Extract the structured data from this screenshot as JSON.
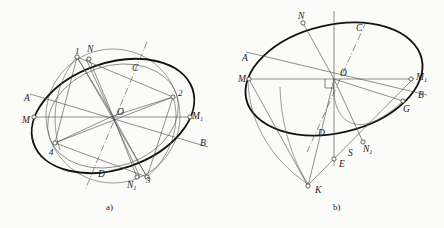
{
  "figure": {
    "background": "#fbfbf9",
    "stroke_main": "#121212",
    "stroke_thin": "#5e5e5e",
    "width": 444,
    "height": 228
  },
  "captions": {
    "a": "a)",
    "b": "b)"
  },
  "panel_a": {
    "name": "diagram-a",
    "center_label": "O",
    "labels": [
      {
        "id": "one",
        "text": "1",
        "x": 75,
        "y": 54,
        "cls": "lbl-num"
      },
      {
        "id": "N",
        "text": "N",
        "x": 87,
        "y": 52,
        "cls": "lbl"
      },
      {
        "id": "C",
        "text": "C",
        "x": 132,
        "y": 71,
        "cls": "lbl"
      },
      {
        "id": "two",
        "text": "2",
        "x": 178,
        "y": 96,
        "cls": "lbl-num"
      },
      {
        "id": "A",
        "text": "A",
        "x": 24,
        "y": 101,
        "cls": "lbl"
      },
      {
        "id": "M",
        "text": "M",
        "x": 22,
        "y": 123,
        "cls": "lbl"
      },
      {
        "id": "M1",
        "text": "M",
        "sub": "1",
        "x": 192,
        "y": 119,
        "cls": "lbl"
      },
      {
        "id": "O",
        "text": "O",
        "x": 117,
        "y": 115,
        "cls": "lbl"
      },
      {
        "id": "B",
        "text": "B",
        "x": 200,
        "y": 146,
        "cls": "lbl"
      },
      {
        "id": "four",
        "text": "4",
        "x": 49,
        "y": 155,
        "cls": "lbl-num"
      },
      {
        "id": "D",
        "text": "D",
        "x": 98,
        "y": 177,
        "cls": "lbl"
      },
      {
        "id": "N1",
        "text": "N",
        "sub": "1",
        "x": 127,
        "y": 188,
        "cls": "lbl"
      },
      {
        "id": "three",
        "text": "3",
        "x": 146,
        "y": 183,
        "cls": "lbl-num"
      }
    ]
  },
  "panel_b": {
    "name": "diagram-b",
    "center_label": "O",
    "labels": [
      {
        "id": "N",
        "text": "N",
        "x": 298,
        "y": 19,
        "cls": "lbl"
      },
      {
        "id": "C",
        "text": "C",
        "x": 356,
        "y": 31,
        "cls": "lbl"
      },
      {
        "id": "A",
        "text": "A",
        "x": 242,
        "y": 61,
        "cls": "lbl"
      },
      {
        "id": "O",
        "text": "O",
        "x": 340,
        "y": 76,
        "cls": "lbl"
      },
      {
        "id": "M",
        "text": "M",
        "x": 240,
        "y": 81,
        "cls": "lbl"
      },
      {
        "id": "M1",
        "text": "M",
        "sub": "1",
        "x": 419,
        "y": 80,
        "cls": "lbl"
      },
      {
        "id": "B",
        "text": "B",
        "x": 419,
        "y": 98,
        "cls": "lbl"
      },
      {
        "id": "G",
        "text": "G",
        "x": 404,
        "y": 112,
        "cls": "lbl"
      },
      {
        "id": "D",
        "text": "D",
        "x": 319,
        "y": 136,
        "cls": "lbl"
      },
      {
        "id": "N1",
        "text": "N",
        "sub": "1",
        "x": 365,
        "y": 150,
        "cls": "lbl"
      },
      {
        "id": "S",
        "text": "S",
        "x": 349,
        "y": 155,
        "cls": "lbl"
      },
      {
        "id": "E",
        "text": "E",
        "x": 340,
        "y": 166,
        "cls": "lbl"
      },
      {
        "id": "K",
        "text": "K",
        "x": 316,
        "y": 192,
        "cls": "lbl"
      }
    ]
  }
}
